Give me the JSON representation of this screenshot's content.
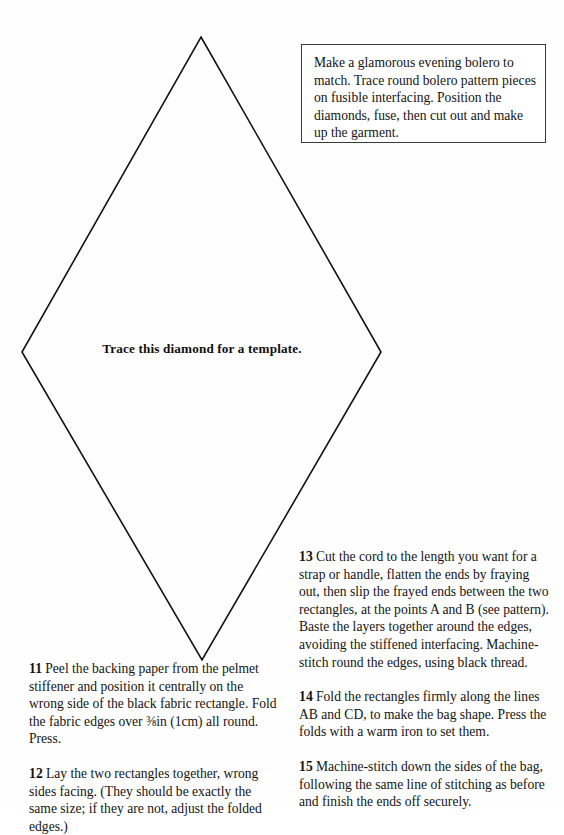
{
  "page": {
    "background_color": "#fefefe",
    "ink_color": "#141414"
  },
  "diamond": {
    "caption": "Trace this diamond for a template.",
    "stroke_color": "#121212",
    "points": "201,37 381,352 202,660 22,352"
  },
  "note_box": {
    "border_color": "#3b3b3b",
    "text": "Make a glamorous evening bolero to match. Trace round bolero pattern pieces on fusible interfacing. Position the diamonds, fuse, then cut out and make up the garment."
  },
  "left_column": {
    "paragraphs": [
      {
        "number": "11",
        "text_before_fraction": "Peel the backing paper from the pelmet stiffener and position it centrally on the wrong side of the black fabric rectangle. Fold the fabric edges over ",
        "fraction": "⅜",
        "text_after_fraction": "in (1cm) all round. Press."
      },
      {
        "number": "12",
        "text": "Lay the two rectangles together, wrong sides facing. (They should be exactly the same size; if they are not, adjust the folded edges.)"
      }
    ]
  },
  "right_column": {
    "paragraphs": [
      {
        "number": "13",
        "text": "Cut the cord to the length you want for a strap or handle, flatten the ends by fraying out, then slip the frayed ends between the two rectangles, at the points A and B (see pattern). Baste the layers together around the edges, avoiding the stiffened interfacing. Machine-stitch round the edges, using black thread."
      },
      {
        "number": "14",
        "text": "Fold the rectangles firmly along the lines AB and CD, to make the bag shape. Press the folds with a warm iron to set them."
      },
      {
        "number": "15",
        "text": "Machine-stitch down the sides of the bag, following the same line of stitching as before and finish the ends off securely."
      }
    ]
  }
}
